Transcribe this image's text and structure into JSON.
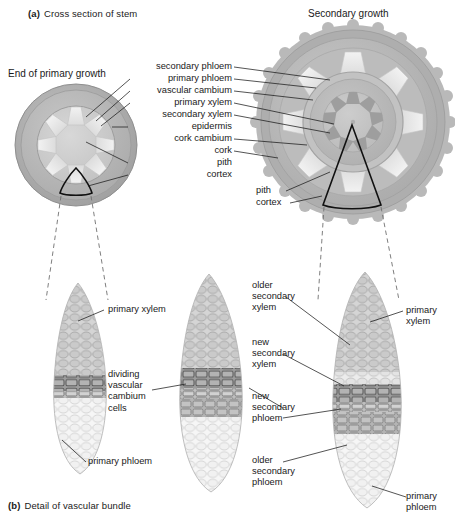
{
  "figure": {
    "panel_a": {
      "tag": "(a)",
      "caption": "Cross section of stem"
    },
    "panel_b": {
      "tag": "(b)",
      "caption": "Detail of vascular bundle"
    }
  },
  "panel_a": {
    "left_diagram_title": "End of primary growth",
    "right_diagram_title": "Secondary  growth",
    "center_labels": [
      "secondary phloem",
      "primary phloem",
      "vascular cambium",
      "primary xylem",
      "secondary xylem",
      "epidermis",
      "cork cambium",
      "cork",
      "pith",
      "cortex"
    ],
    "right_labels": [
      "pith",
      "cortex"
    ]
  },
  "panel_b": {
    "bundle1_labels": {
      "xylem": "primary xylem",
      "phloem": "primary phloem"
    },
    "bundle2_labels": {
      "cambium": "dividing\nvascular\ncambium\ncells",
      "cambium_lines": [
        "dividing",
        "vascular",
        "cambium",
        "cells"
      ]
    },
    "middle_labels": [
      {
        "lines": [
          "older",
          "secondary",
          "xylem"
        ]
      },
      {
        "lines": [
          "new",
          "secondary",
          "xylem"
        ]
      },
      {
        "lines": [
          "new",
          "secondary",
          "phloem"
        ]
      },
      {
        "lines": [
          "older",
          "secondary",
          "phloem"
        ]
      }
    ],
    "bundle3_labels": {
      "xylem_lines": [
        "primary",
        "xylem"
      ],
      "phloem_lines": [
        "primary",
        "phloem"
      ]
    }
  },
  "colors": {
    "epidermis": "#b0b0b0",
    "cortex": "#bdbdbd",
    "cork": "#a9a9a9",
    "pith": "#c9c9c9",
    "vascular_bundle": "#e8e8e8",
    "secondary_xylem": "#b8b8b8",
    "primary_xylem_dark": "#9a9a9a",
    "cell_light": "#e6e6e6",
    "cell_mid": "#c4c4c4",
    "cell_dark": "#8f8f8f",
    "leader": "#1b1b1b",
    "dashed": "#6f6f6f",
    "text": "#1a1a1a",
    "background": "#ffffff"
  }
}
